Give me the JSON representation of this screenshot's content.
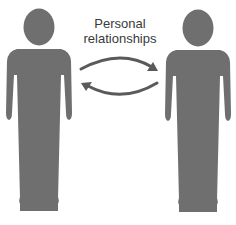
{
  "diagram": {
    "label_lines": [
      "Personal",
      "relationships"
    ],
    "figure_color": "#6f6f6f",
    "arrow_color": "#5a5a5a",
    "background": "#ffffff",
    "nodes": [
      {
        "id": "person-left",
        "icon": "person-icon"
      },
      {
        "id": "person-right",
        "icon": "person-icon"
      }
    ],
    "edges": [
      {
        "from": "person-left",
        "to": "person-right",
        "icon": "arrow-right-curved-icon"
      },
      {
        "from": "person-right",
        "to": "person-left",
        "icon": "arrow-left-curved-icon"
      }
    ]
  }
}
